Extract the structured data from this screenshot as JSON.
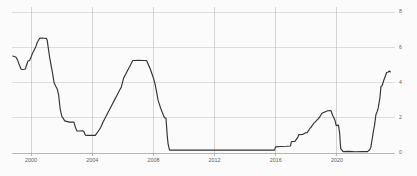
{
  "chart_data": {
    "type": "line",
    "title": "",
    "subtitle": "",
    "xlabel": "",
    "ylabel": "",
    "xlim": [
      1998.75,
      2023.6
    ],
    "ylim": [
      0,
      8
    ],
    "grid": true,
    "legend": false,
    "legend_position": "none",
    "line_color": "#33322f",
    "grid_color": "#c9c9c9",
    "background_color": "#fbfbfb",
    "axis_color": "#9a9a9a",
    "y_axis_side": "right",
    "ytick_labels": [
      "0",
      "2",
      "4",
      "6",
      "8"
    ],
    "ytick_values": [
      0,
      2,
      4,
      6,
      8
    ],
    "xtick_labels": [
      "2000",
      "2004",
      "2008",
      "2012",
      "2016",
      "2020"
    ],
    "xtick_values": [
      2000,
      2004,
      2008,
      2012,
      2016,
      2020
    ],
    "series": [
      {
        "name": "rate",
        "x": [
          1998.8,
          1999.0,
          1999.1,
          1999.25,
          1999.35,
          1999.45,
          1999.55,
          1999.62,
          1999.7,
          1999.8,
          1999.9,
          2000.0,
          2000.1,
          2000.2,
          2000.3,
          2000.4,
          2000.55,
          2000.7,
          2000.85,
          2001.0,
          2001.05,
          2001.12,
          2001.2,
          2001.3,
          2001.4,
          2001.5,
          2001.6,
          2001.7,
          2001.8,
          2001.9,
          2002.0,
          2002.2,
          2002.5,
          2002.8,
          2002.9,
          2003.0,
          2003.2,
          2003.35,
          2003.45,
          2003.55,
          2003.7,
          2003.9,
          2004.0,
          2004.2,
          2004.4,
          2004.55,
          2004.7,
          2004.85,
          2005.0,
          2005.15,
          2005.3,
          2005.45,
          2005.6,
          2005.75,
          2005.9,
          2006.05,
          2006.2,
          2006.35,
          2006.5,
          2006.65,
          2006.8,
          2007.0,
          2007.3,
          2007.55,
          2007.7,
          2007.8,
          2007.9,
          2008.0,
          2008.1,
          2008.2,
          2008.3,
          2008.45,
          2008.6,
          2008.72,
          2008.82,
          2008.9,
          2008.96,
          2009.05,
          2009.5,
          2010.0,
          2010.5,
          2011.0,
          2011.5,
          2012.0,
          2012.5,
          2013.0,
          2013.5,
          2014.0,
          2014.5,
          2015.0,
          2015.5,
          2015.92,
          2015.98,
          2016.3,
          2016.7,
          2016.96,
          2017.02,
          2017.25,
          2017.45,
          2017.5,
          2017.75,
          2017.95,
          2018.05,
          2018.25,
          2018.3,
          2018.5,
          2018.55,
          2018.75,
          2018.8,
          2018.98,
          2019.05,
          2019.4,
          2019.58,
          2019.62,
          2019.72,
          2019.78,
          2019.88,
          2019.95,
          2020.1,
          2020.18,
          2020.21,
          2020.25,
          2020.4,
          2020.8,
          2021.2,
          2021.6,
          2022.0,
          2022.15,
          2022.22,
          2022.3,
          2022.38,
          2022.46,
          2022.55,
          2022.62,
          2022.7,
          2022.8,
          2022.88,
          2022.96,
          2023.05,
          2023.15,
          2023.25,
          2023.33,
          2023.42,
          2023.5
        ],
        "values": [
          5.5,
          5.45,
          5.3,
          4.95,
          4.75,
          4.74,
          4.75,
          4.76,
          4.99,
          5.22,
          5.25,
          5.45,
          5.68,
          5.85,
          6.02,
          6.27,
          6.5,
          6.52,
          6.51,
          6.5,
          6.4,
          5.98,
          5.49,
          5.0,
          4.55,
          4.0,
          3.8,
          3.65,
          3.3,
          2.5,
          2.1,
          1.82,
          1.75,
          1.75,
          1.44,
          1.25,
          1.25,
          1.26,
          1.22,
          1.01,
          1.0,
          1.0,
          1.0,
          1.0,
          1.25,
          1.45,
          1.75,
          2.0,
          2.25,
          2.5,
          2.75,
          3.0,
          3.25,
          3.5,
          3.75,
          4.25,
          4.5,
          4.75,
          4.99,
          5.25,
          5.25,
          5.26,
          5.25,
          5.25,
          4.95,
          4.75,
          4.5,
          4.25,
          3.94,
          3.5,
          3.0,
          2.6,
          2.25,
          2.0,
          1.98,
          1.0,
          0.5,
          0.16,
          0.16,
          0.16,
          0.16,
          0.16,
          0.16,
          0.16,
          0.16,
          0.16,
          0.16,
          0.16,
          0.16,
          0.16,
          0.16,
          0.16,
          0.35,
          0.37,
          0.38,
          0.4,
          0.65,
          0.66,
          0.9,
          1.04,
          1.05,
          1.15,
          1.16,
          1.42,
          1.45,
          1.7,
          1.74,
          1.92,
          1.95,
          2.2,
          2.27,
          2.4,
          2.41,
          2.38,
          2.13,
          2.04,
          1.83,
          1.55,
          1.58,
          1.1,
          0.65,
          0.25,
          0.08,
          0.09,
          0.07,
          0.08,
          0.08,
          0.2,
          0.33,
          0.77,
          1.21,
          1.58,
          2.19,
          2.33,
          2.56,
          3.08,
          3.78,
          3.83,
          4.1,
          4.33,
          4.57,
          4.58,
          4.65,
          4.6
        ]
      }
    ]
  }
}
